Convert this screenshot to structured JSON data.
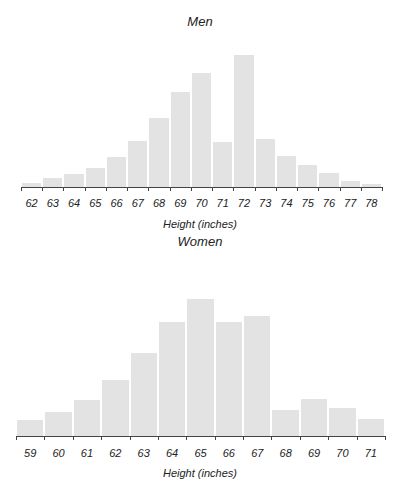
{
  "chart_data": [
    {
      "type": "bar",
      "title": "Men",
      "xlabel": "Height (inches)",
      "ylabel": "",
      "categories": [
        "62",
        "63",
        "64",
        "65",
        "66",
        "67",
        "68",
        "69",
        "70",
        "71",
        "72",
        "73",
        "74",
        "75",
        "76",
        "77",
        "78"
      ],
      "values": [
        4,
        9,
        13,
        19,
        30,
        46,
        69,
        95,
        114,
        45,
        132,
        48,
        31,
        22,
        14,
        6,
        3
      ],
      "value_units": "relative bar height (px, no y-axis shown)",
      "grid": false,
      "legend": null
    },
    {
      "type": "bar",
      "title": "Women",
      "xlabel": "Height (inches)",
      "ylabel": "",
      "categories": [
        "59",
        "60",
        "61",
        "62",
        "63",
        "64",
        "65",
        "66",
        "67",
        "68",
        "69",
        "70",
        "71"
      ],
      "values": [
        16,
        24,
        36,
        56,
        83,
        114,
        137,
        114,
        120,
        26,
        37,
        28,
        17
      ],
      "value_units": "relative bar height (px, no y-axis shown)",
      "grid": false,
      "legend": null
    }
  ],
  "colors": {
    "bar": "#e3e3e3",
    "axis": "#444444",
    "text": "#222222"
  }
}
